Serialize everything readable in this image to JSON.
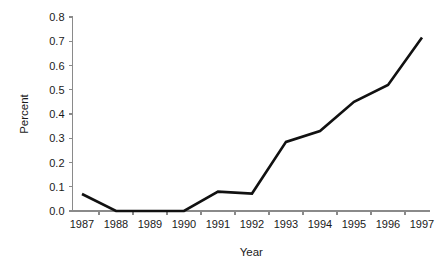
{
  "chart_data": {
    "type": "line",
    "title": "",
    "xlabel": "Year",
    "ylabel": "Percent",
    "categories": [
      "1987",
      "1988",
      "1989",
      "1990",
      "1991",
      "1992",
      "1993",
      "1994",
      "1995",
      "1996",
      "1997"
    ],
    "x": [
      1987,
      1988,
      1989,
      1990,
      1991,
      1992,
      1993,
      1994,
      1995,
      1996,
      1997
    ],
    "values": [
      0.07,
      0.0,
      0.0,
      0.0,
      0.08,
      0.072,
      0.285,
      0.33,
      0.45,
      0.52,
      0.715
    ],
    "series": [
      {
        "name": "Percent",
        "values": [
          0.07,
          0.0,
          0.0,
          0.0,
          0.08,
          0.072,
          0.285,
          0.33,
          0.45,
          0.52,
          0.715
        ],
        "color": "#111111"
      }
    ],
    "ylim": [
      0.0,
      0.8
    ],
    "ytick_labels": [
      "0.0",
      "0.1",
      "0.2",
      "0.3",
      "0.4",
      "0.5",
      "0.6",
      "0.7",
      "0.8"
    ],
    "ytick_values": [
      0.0,
      0.1,
      0.2,
      0.3,
      0.4,
      0.5,
      0.6,
      0.7,
      0.8
    ],
    "xtick_labels": [
      "1987",
      "1988",
      "1989",
      "1990",
      "1991",
      "1992",
      "1993",
      "1994",
      "1995",
      "1996",
      "1997"
    ],
    "grid": false,
    "legend": false,
    "legend_position": "none",
    "background_color": "#ffffff",
    "axis_color": "#8a8a8a",
    "line_color": "#111111"
  }
}
